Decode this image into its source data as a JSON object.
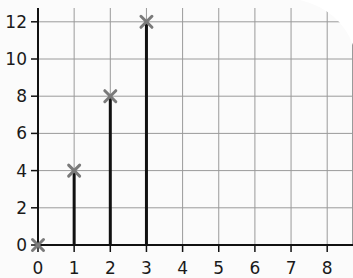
{
  "chart_data": {
    "type": "bar",
    "subtype": "stem",
    "title": "",
    "xlabel": "",
    "ylabel": "",
    "x": [
      0,
      1,
      2,
      3
    ],
    "values": [
      0,
      4,
      8,
      12
    ],
    "x_ticks": [
      "0",
      "1",
      "2",
      "3",
      "4",
      "5",
      "6",
      "7",
      "8"
    ],
    "y_ticks": [
      "0",
      "2",
      "4",
      "6",
      "8",
      "10",
      "12"
    ],
    "xlim": [
      0,
      8
    ],
    "ylim": [
      0,
      12
    ],
    "grid": true,
    "legend": null,
    "marker": "x",
    "colors": {
      "stem": "#111111",
      "marker": "#7a7a7a",
      "grid": "#9a9a9a",
      "axis": "#111111",
      "paper": "#fbfbfb"
    }
  }
}
